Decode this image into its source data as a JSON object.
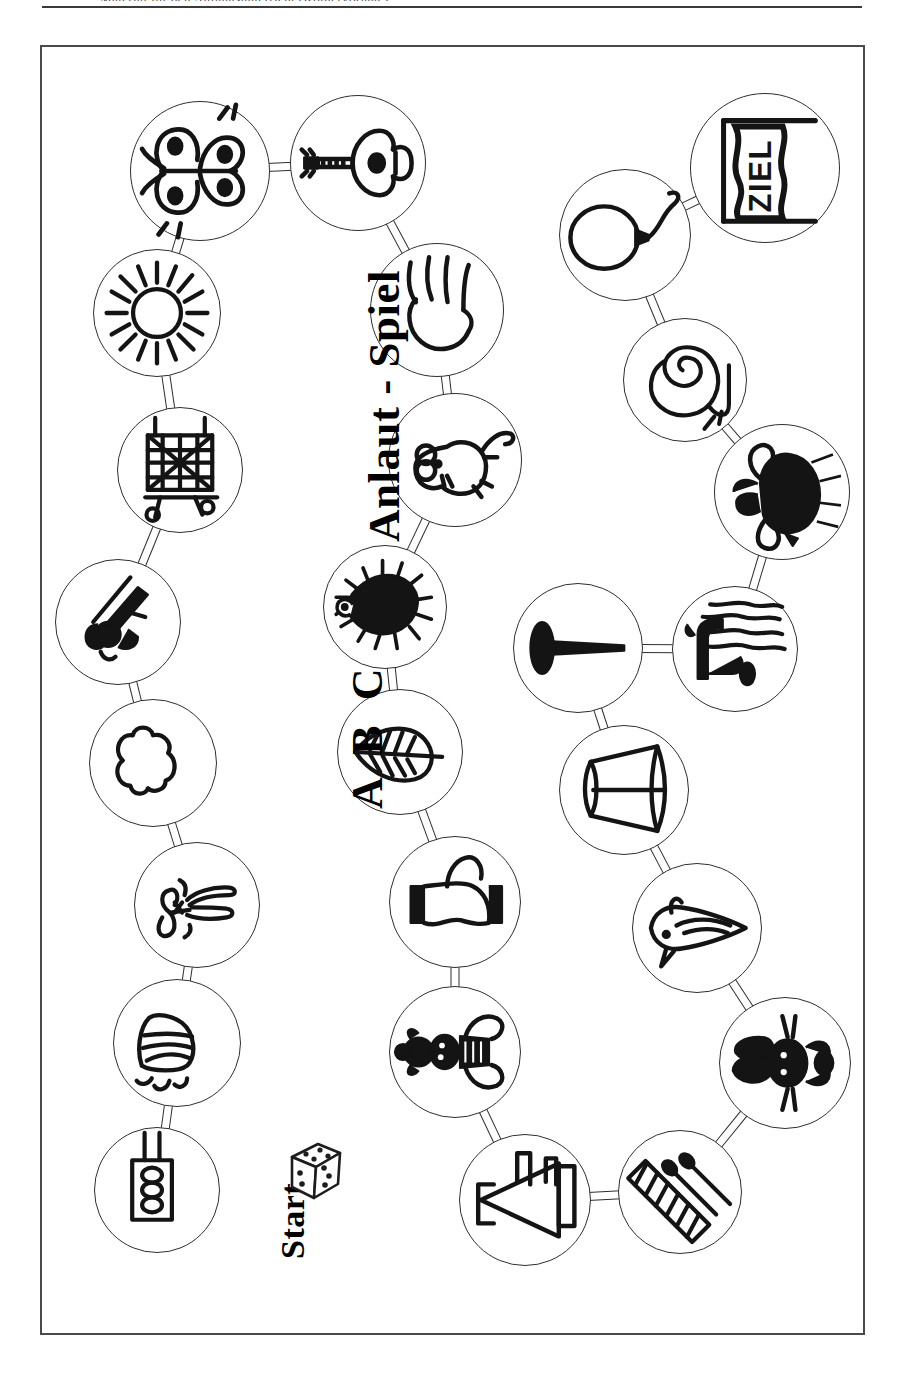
{
  "page": {
    "header_fragment": "Material für den Anfangsunterricht (Kopiervorlage)",
    "rule_visible": true
  },
  "board": {
    "title": "Anlaut - Spiel",
    "subtitle": "A B C",
    "start_label": "Start",
    "goal_label": "ZIEL",
    "orientation": "landscape-rotated",
    "frame_color": "#4a4a4a",
    "ink_color": "#2e2e2e",
    "dice_pips": 11
  },
  "spaces": [
    {
      "id": 1,
      "icon": "electric-plug-icon",
      "name_de": "Stecker",
      "cx": 157,
      "cy": 1190,
      "r": 63,
      "is_start": true
    },
    {
      "id": 2,
      "icon": "broom-icon",
      "name_de": "Besen",
      "cx": 177,
      "cy": 1043,
      "r": 64
    },
    {
      "id": 3,
      "icon": "person-bow-icon",
      "name_de": "Puppe",
      "cx": 197,
      "cy": 905,
      "r": 63
    },
    {
      "id": 4,
      "icon": "cloud-icon",
      "name_de": "Wolke",
      "cx": 153,
      "cy": 763,
      "r": 64
    },
    {
      "id": 5,
      "icon": "hunter-rifle-icon",
      "name_de": "Jäger",
      "cx": 118,
      "cy": 622,
      "r": 63
    },
    {
      "id": 6,
      "icon": "fence-net-icon",
      "name_de": "Netz",
      "cx": 180,
      "cy": 470,
      "r": 63
    },
    {
      "id": 7,
      "icon": "sun-icon",
      "name_de": "Sonne",
      "cx": 157,
      "cy": 313,
      "r": 64
    },
    {
      "id": 8,
      "icon": "butterfly-icon",
      "name_de": "Schmetterling",
      "cx": 200,
      "cy": 171,
      "r": 70
    },
    {
      "id": 9,
      "icon": "guitar-icon",
      "name_de": "Gitarre",
      "cx": 358,
      "cy": 163,
      "r": 68
    },
    {
      "id": 10,
      "icon": "hand-icon",
      "name_de": "Hand",
      "cx": 437,
      "cy": 310,
      "r": 67
    },
    {
      "id": 11,
      "icon": "mouse-icon",
      "name_de": "Maus",
      "cx": 455,
      "cy": 460,
      "r": 67
    },
    {
      "id": 12,
      "icon": "hedgehog-icon",
      "name_de": "Igel",
      "cx": 385,
      "cy": 607,
      "r": 62
    },
    {
      "id": 13,
      "icon": "leaf-icon",
      "name_de": "Blatt",
      "cx": 400,
      "cy": 752,
      "r": 63
    },
    {
      "id": 14,
      "icon": "sock-icon",
      "name_de": "Socke",
      "cx": 455,
      "cy": 902,
      "r": 66
    },
    {
      "id": 15,
      "icon": "clown-doll-icon",
      "name_de": "Clown",
      "cx": 455,
      "cy": 1052,
      "r": 66
    },
    {
      "id": 16,
      "icon": "crown-icon",
      "name_de": "Krone",
      "cx": 525,
      "cy": 1200,
      "r": 66
    },
    {
      "id": 17,
      "icon": "matches-icon",
      "name_de": "Streichhölzer",
      "cx": 680,
      "cy": 1192,
      "r": 62
    },
    {
      "id": 18,
      "icon": "rabbit-icon",
      "name_de": "Hase",
      "cx": 785,
      "cy": 1063,
      "r": 66
    },
    {
      "id": 19,
      "icon": "bird-icon",
      "name_de": "Vogel",
      "cx": 697,
      "cy": 928,
      "r": 65
    },
    {
      "id": 20,
      "icon": "lampshade-icon",
      "name_de": "Lampe",
      "cx": 624,
      "cy": 790,
      "r": 65
    },
    {
      "id": 21,
      "icon": "nail-icon",
      "name_de": "Nagel",
      "cx": 578,
      "cy": 648,
      "r": 65
    },
    {
      "id": 22,
      "icon": "faucet-icon",
      "name_de": "Wasserhahn",
      "cx": 735,
      "cy": 649,
      "r": 63
    },
    {
      "id": 23,
      "icon": "bull-icon",
      "name_de": "Stier",
      "cx": 782,
      "cy": 492,
      "r": 68
    },
    {
      "id": 24,
      "icon": "snail-icon",
      "name_de": "Schnecke",
      "cx": 685,
      "cy": 380,
      "r": 62
    },
    {
      "id": 25,
      "icon": "balloon-icon",
      "name_de": "Luftballon",
      "cx": 625,
      "cy": 235,
      "r": 66
    },
    {
      "id": 26,
      "icon": "goal-flag-icon",
      "name_de": "ZIEL",
      "cx": 765,
      "cy": 168,
      "r": 75,
      "is_goal": true
    }
  ],
  "connectors": [
    {
      "from": 1,
      "to": 2
    },
    {
      "from": 2,
      "to": 3
    },
    {
      "from": 3,
      "to": 4
    },
    {
      "from": 4,
      "to": 5
    },
    {
      "from": 5,
      "to": 6
    },
    {
      "from": 6,
      "to": 7
    },
    {
      "from": 7,
      "to": 8
    },
    {
      "from": 8,
      "to": 9
    },
    {
      "from": 9,
      "to": 10
    },
    {
      "from": 10,
      "to": 11
    },
    {
      "from": 11,
      "to": 12
    },
    {
      "from": 12,
      "to": 13
    },
    {
      "from": 13,
      "to": 14
    },
    {
      "from": 14,
      "to": 15
    },
    {
      "from": 15,
      "to": 16
    },
    {
      "from": 16,
      "to": 17
    },
    {
      "from": 17,
      "to": 18
    },
    {
      "from": 18,
      "to": 19
    },
    {
      "from": 19,
      "to": 20
    },
    {
      "from": 20,
      "to": 21
    },
    {
      "from": 21,
      "to": 22
    },
    {
      "from": 22,
      "to": 23
    },
    {
      "from": 23,
      "to": 24
    },
    {
      "from": 24,
      "to": 25
    },
    {
      "from": 25,
      "to": 26
    }
  ]
}
